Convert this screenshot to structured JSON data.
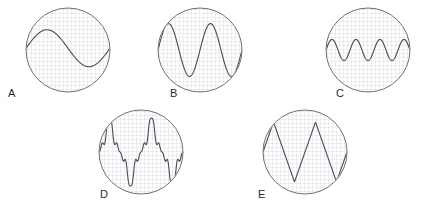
{
  "figure": {
    "width": 434,
    "height": 204,
    "background_color": "#ffffff",
    "grid_color": "#c9c6d6",
    "grid_spacing_px": 4,
    "circle_stroke_color": "#6e6e78",
    "trace_color": "#4a4a55",
    "label_color": "#2b2b2b"
  },
  "scopes": [
    {
      "label": "A",
      "cx": 68,
      "cy": 50,
      "r": 42,
      "label_x": 8,
      "label_y": 88,
      "waveform": {
        "name": "sine",
        "type": "line",
        "cycles": 1,
        "amplitude_div": 2.1,
        "baseline_offset_div": 0.2,
        "phase_deg": 0,
        "description": "one low-frequency sine cycle, moderate amplitude"
      }
    },
    {
      "label": "B",
      "cx": 200,
      "cy": 50,
      "r": 42,
      "label_x": 170,
      "label_y": 88,
      "waveform": {
        "name": "sine",
        "type": "line",
        "cycles": 2,
        "amplitude_div": 3.0,
        "baseline_offset_div": 0,
        "phase_deg": 0,
        "description": "two sine cycles, large amplitude"
      }
    },
    {
      "label": "C",
      "cx": 368,
      "cy": 50,
      "r": 42,
      "label_x": 336,
      "label_y": 88,
      "waveform": {
        "name": "sine",
        "type": "line",
        "cycles": 3.5,
        "amplitude_div": 1.2,
        "baseline_offset_div": 0,
        "phase_deg": 0,
        "description": "three and a half sine cycles, small amplitude"
      }
    },
    {
      "label": "D",
      "cx": 141,
      "cy": 152,
      "r": 42,
      "label_x": 100,
      "label_y": 189,
      "waveform": {
        "name": "complex-notched",
        "type": "line",
        "cycles": 2,
        "amplitude_div": 3.0,
        "baseline_offset_div": 0,
        "harmonics": [
          {
            "order": 1,
            "amp": 1.0,
            "phase_deg": 0
          },
          {
            "order": 3,
            "amp": 0.3,
            "phase_deg": 180
          },
          {
            "order": 5,
            "amp": 0.18,
            "phase_deg": 0
          },
          {
            "order": 9,
            "amp": 0.09,
            "phase_deg": 180
          }
        ],
        "description": "complex distorted wave with notched crests and troughs"
      }
    },
    {
      "label": "E",
      "cx": 305,
      "cy": 152,
      "r": 42,
      "label_x": 258,
      "label_y": 189,
      "waveform": {
        "name": "triangle",
        "type": "line",
        "cycles": 2,
        "amplitude_div": 3.4,
        "baseline_offset_div": 0,
        "description": "two-cycle triangular wave with straight steep ramps"
      }
    }
  ],
  "chart_data": {
    "type": "line",
    "xlabel": "",
    "ylabel": "",
    "grid": true,
    "legend": false,
    "panels": [
      {
        "name": "A",
        "waveform": "sine",
        "cycles": 1,
        "relative_amplitude": 0.5,
        "x": [
          0,
          0.125,
          0.25,
          0.375,
          0.5,
          0.625,
          0.75,
          0.875,
          1
        ],
        "y": [
          0.12,
          0.42,
          0.5,
          0.42,
          0.12,
          -0.24,
          -0.45,
          -0.36,
          -0.05
        ]
      },
      {
        "name": "B",
        "waveform": "sine",
        "cycles": 2,
        "relative_amplitude": 0.72,
        "x": [
          0,
          0.125,
          0.25,
          0.375,
          0.5,
          0.625,
          0.75,
          0.875,
          1
        ],
        "y": [
          0.0,
          0.72,
          0.0,
          -0.72,
          0.0,
          0.72,
          0.0,
          -0.72,
          0.0
        ]
      },
      {
        "name": "C",
        "waveform": "sine",
        "cycles": 3.5,
        "relative_amplitude": 0.28,
        "x": [
          0,
          0.143,
          0.286,
          0.429,
          0.571,
          0.714,
          0.857,
          1
        ],
        "y": [
          0.0,
          0.28,
          0.0,
          -0.28,
          0.0,
          0.28,
          0.0,
          -0.28
        ]
      },
      {
        "name": "D",
        "waveform": "complex-notched",
        "cycles": 2,
        "relative_amplitude": 0.72,
        "x": [
          0,
          0.0625,
          0.125,
          0.1875,
          0.25,
          0.3125,
          0.375,
          0.4375,
          0.5,
          0.5625,
          0.625,
          0.6875,
          0.75,
          0.8125,
          0.875,
          0.9375,
          1
        ],
        "y": [
          0.55,
          0.62,
          0.48,
          0.0,
          -0.55,
          -0.38,
          -0.62,
          -0.35,
          0.2,
          0.62,
          0.5,
          0.62,
          0.0,
          -0.55,
          -0.62,
          -0.2,
          0.55
        ]
      },
      {
        "name": "E",
        "waveform": "triangle",
        "cycles": 2,
        "relative_amplitude": 0.82,
        "x": [
          0,
          0.125,
          0.375,
          0.625,
          0.875,
          1
        ],
        "y": [
          -0.2,
          0.82,
          -0.82,
          0.82,
          -0.82,
          -0.2
        ]
      }
    ]
  }
}
